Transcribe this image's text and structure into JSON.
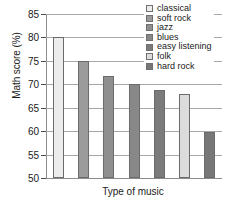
{
  "chart_data": {
    "type": "bar",
    "title": "",
    "xlabel": "Type of music",
    "ylabel": "Math score (%)",
    "categories": [
      "classical",
      "soft rock",
      "jazz",
      "blues",
      "easy listening",
      "folk",
      "hard rock"
    ],
    "values": [
      80,
      75,
      71.7,
      70,
      68.8,
      67.9,
      59.9
    ],
    "ylim": [
      50,
      85
    ],
    "yticks": [
      50,
      55,
      60,
      65,
      70,
      75,
      80,
      85
    ],
    "ytick_labels": [
      "50",
      "55",
      "60",
      "65",
      "70",
      "75",
      "80",
      "85"
    ],
    "xtick_labels": [],
    "grid": "horizontal",
    "legend_position": "top-right",
    "series_colors": [
      "#ececec",
      "#9b9b9b",
      "#8f8f8f",
      "#888888",
      "#7b7b7b",
      "#dcdcdc",
      "#777777"
    ],
    "bar_edge_color": "#6b6b6b",
    "legend": [
      {
        "label": "classical",
        "color": "#ececec"
      },
      {
        "label": "soft rock",
        "color": "#9b9b9b"
      },
      {
        "label": "jazz",
        "color": "#8f8f8f"
      },
      {
        "label": "blues",
        "color": "#888888"
      },
      {
        "label": "easy listening",
        "color": "#7b7b7b"
      },
      {
        "label": "folk",
        "color": "#dcdcdc"
      },
      {
        "label": "hard rock",
        "color": "#777777"
      }
    ]
  },
  "axis_color": "#8c8c8c",
  "grid_color": "#a8a8a8",
  "text_color": "#1a1a1a",
  "background": "#ffffff"
}
